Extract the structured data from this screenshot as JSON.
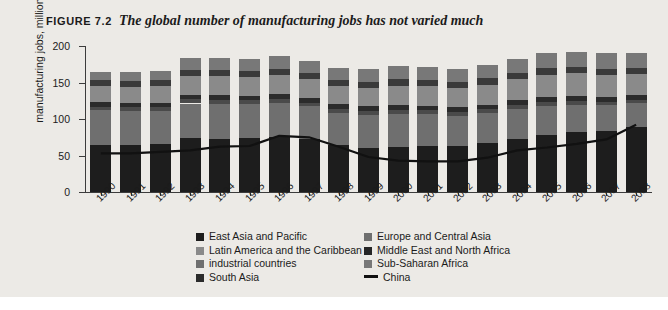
{
  "figure": {
    "label": "FIGURE 7.2",
    "caption": "The global number of manufacturing jobs has not varied much",
    "panel_color": "#eceae6"
  },
  "chart_data": {
    "type": "bar",
    "stacked": true,
    "title": "The global number of manufacturing jobs has not varied much",
    "xlabel": "",
    "ylabel": "manufacturing jobs, millions",
    "ylim": [
      0,
      200
    ],
    "yticks": [
      0,
      50,
      100,
      150,
      200
    ],
    "grid": false,
    "legend_position": "bottom",
    "categories": [
      "1990",
      "1991",
      "1992",
      "1993",
      "1994",
      "1995",
      "1996",
      "1997",
      "1998",
      "1999",
      "2000",
      "2001",
      "2002",
      "2003",
      "2004",
      "2005",
      "2006",
      "2007",
      "2008"
    ],
    "series": [
      {
        "name": "East Asia and Pacific",
        "color": "#1d1d1d",
        "values": [
          65,
          64,
          66,
          67,
          68,
          69,
          70,
          69,
          62,
          57,
          56,
          57,
          58,
          62,
          66,
          69,
          75,
          80,
          90
        ]
      },
      {
        "name": "industrial countries",
        "color": "#6f6f6f",
        "values": [
          47,
          47,
          45,
          43,
          44,
          44,
          44,
          43,
          42,
          44,
          42,
          40,
          38,
          37,
          36,
          35,
          34,
          33,
          32
        ]
      },
      {
        "name": "Europe and Central Asia",
        "color": "#4a4a4a",
        "values": [
          5,
          5,
          5,
          5,
          5,
          5,
          5,
          5,
          5,
          5,
          5,
          5,
          5,
          5,
          5,
          5,
          5,
          5,
          5
        ]
      },
      {
        "name": "South Asia",
        "color": "#2b2b2b",
        "values": [
          6,
          6,
          6,
          6,
          6,
          6,
          6,
          6,
          6,
          6,
          6,
          6,
          6,
          6,
          6,
          6,
          6,
          6,
          6
        ]
      },
      {
        "name": "Latin America and the Caribbean",
        "color": "#8a8a8a",
        "values": [
          22,
          22,
          23,
          23,
          24,
          24,
          25,
          25,
          24,
          24,
          24,
          24,
          24,
          25,
          26,
          27,
          28,
          29,
          30
        ]
      },
      {
        "name": "Middle East and North Africa",
        "color": "#3a3a3a",
        "values": [
          8,
          8,
          8,
          8,
          8,
          8,
          8,
          8,
          8,
          8,
          8,
          8,
          8,
          8,
          8,
          8,
          8,
          8,
          8
        ]
      },
      {
        "name": "Sub-Saharan Africa",
        "color": "#787878",
        "values": [
          12,
          13,
          13,
          14,
          15,
          15,
          16,
          16,
          16,
          16,
          16,
          16,
          16,
          17,
          17,
          18,
          19,
          20,
          20
        ]
      }
    ],
    "totals": [
      165,
      165,
      166,
      183,
      183,
      182,
      186,
      180,
      170,
      168,
      172,
      171,
      168,
      174,
      182,
      190,
      192,
      190,
      190
    ],
    "overlay_line": {
      "name": "China",
      "color": "#111111",
      "values": [
        53,
        53,
        55,
        57,
        62,
        63,
        77,
        75,
        62,
        48,
        43,
        42,
        42,
        47,
        57,
        61,
        66,
        72,
        92
      ]
    }
  },
  "legend": {
    "left_column": [
      {
        "label": "East Asia and Pacific",
        "swatch": "#1d1d1d",
        "type": "square"
      },
      {
        "label": "Latin America and the Caribbean",
        "swatch": "#8a8a8a",
        "type": "square"
      },
      {
        "label": "industrial countries",
        "swatch": "#6f6f6f",
        "type": "square"
      },
      {
        "label": "South Asia",
        "swatch": "#2b2b2b",
        "type": "square"
      }
    ],
    "right_column": [
      {
        "label": "Europe and Central Asia",
        "swatch": "#6f6f6f",
        "type": "square"
      },
      {
        "label": "Middle East and North Africa",
        "swatch": "#262626",
        "type": "square"
      },
      {
        "label": "Sub-Saharan Africa",
        "swatch": "#787878",
        "type": "square"
      },
      {
        "label": "China",
        "swatch": "#111111",
        "type": "line"
      }
    ]
  },
  "source_note": ""
}
